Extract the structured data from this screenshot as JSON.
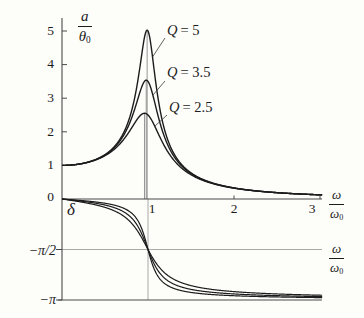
{
  "figure": {
    "bg": "#fdfdfa",
    "curve_color": "#1c1c1c",
    "axis_color": "#4a4a4a",
    "grid_color": "#a9a9a9",
    "leader_color": "#3a3a3a",
    "drop_line_color": "#8a8a8a"
  },
  "labels": {
    "amplitude_fraction": {
      "num": "a",
      "den_base": "θ",
      "den_sub": "0"
    },
    "omega_fraction": {
      "num": "ω",
      "den_base": "ω",
      "den_sub": "0"
    },
    "delta": "δ"
  },
  "top_plot": {
    "y_tick_labels": [
      "5",
      "4",
      "3",
      "2",
      "1",
      "0"
    ],
    "x_tick_labels": [
      "1",
      "2",
      "3"
    ]
  },
  "bottom_plot": {
    "y_tick_labels": [
      "−π/2",
      "−π"
    ]
  },
  "chart_data": [
    {
      "type": "line",
      "title": "Amplitude resonance curves of a driven oscillator",
      "xlabel": "ω/ω₀",
      "ylabel": "a/θ₀",
      "xlim": [
        0,
        3.05
      ],
      "ylim": [
        0,
        5.2
      ],
      "x_ticks": [
        1,
        2,
        3
      ],
      "y_ticks": [
        1,
        2,
        3,
        4,
        5
      ],
      "x": [
        0,
        0.25,
        0.5,
        0.75,
        0.9,
        1,
        1.25,
        1.5,
        2,
        2.5,
        3
      ],
      "series": [
        {
          "name": "Q = 5",
          "symbol": "Q",
          "eq": "= 5",
          "Q": 5,
          "values": [
            1,
            1.065,
            1.322,
            2.162,
            3.821,
            5,
            1.625,
            0.778,
            0.331,
            0.19,
            0.125
          ],
          "peak": {
            "x": 0.99,
            "y": 5.03
          }
        },
        {
          "name": "Q = 3.5",
          "symbol": "Q",
          "eq": "= 3.5",
          "Q": 3.5,
          "values": [
            1,
            1.064,
            1.31,
            2.053,
            3.128,
            3.5,
            1.501,
            0.757,
            0.327,
            0.189,
            0.124
          ],
          "peak": {
            "x": 0.98,
            "y": 3.54
          }
        },
        {
          "name": "Q = 2.5",
          "symbol": "Q",
          "eq": "= 2.5",
          "Q": 2.5,
          "values": [
            1,
            1.061,
            1.288,
            1.885,
            2.456,
            2.5,
            1.329,
            0.721,
            0.322,
            0.187,
            0.124
          ],
          "peak": {
            "x": 0.96,
            "y": 2.55
          }
        }
      ],
      "formula": "a/θ₀ = 1/√((1−u²)² + (u/Q)²), u = ω/ω₀",
      "grid": "thin vertical drop lines at each resonance peak",
      "legend_position": "Q labels with leader lines right of peaks"
    },
    {
      "type": "line",
      "title": "Phase lag δ vs drive frequency",
      "xlabel": "ω/ω₀",
      "ylabel": "δ",
      "xlim": [
        0,
        3.05
      ],
      "ylim_over_pi": [
        -1,
        0
      ],
      "y_ticks": [
        "0",
        "−π/2",
        "−π"
      ],
      "x": [
        0,
        0.25,
        0.5,
        0.75,
        0.9,
        1,
        1.25,
        1.5,
        2,
        2.5,
        3
      ],
      "series": [
        {
          "name": "Q = 5",
          "Q": 5,
          "values_delta_over_pi": [
            0,
            -0.017,
            -0.042,
            -0.105,
            -0.241,
            -0.5,
            -0.867,
            -0.925,
            -0.958,
            -0.97,
            -0.976
          ]
        },
        {
          "name": "Q = 3.5",
          "Q": 3.5,
          "values_delta_over_pi": [
            0,
            -0.024,
            -0.06,
            -0.145,
            -0.297,
            -0.5,
            -0.82,
            -0.895,
            -0.94,
            -0.957,
            -0.966
          ]
        },
        {
          "name": "Q = 2.5",
          "Q": 2.5,
          "values_delta_over_pi": [
            0,
            -0.034,
            -0.083,
            -0.191,
            -0.345,
            -0.5,
            -0.769,
            -0.857,
            -0.917,
            -0.94,
            -0.953
          ]
        }
      ],
      "formula": "tan δ = (u/Q)/(u²−1), δ ∈ [−π, 0]; all curves cross δ = −π/2 at u = 1",
      "grid": "vertical gray line at ω/ω₀ = 1; horizontal lines at −π/2 and −π"
    }
  ]
}
